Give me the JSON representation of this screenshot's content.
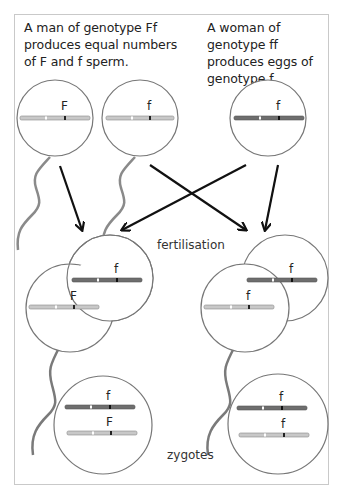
{
  "captions": {
    "man": "A man of genotype Ff produces equal numbers of F and f sperm.",
    "woman": "A woman of genotype ff produces eggs of genotype f."
  },
  "labels": {
    "fertilisation": "fertilisation",
    "zygotes": "zygotes"
  },
  "gametes": {
    "sperm_1": {
      "allele": "F",
      "chromosome_color": "#c8c8c8"
    },
    "sperm_2": {
      "allele": "f",
      "chromosome_color": "#c8c8c8"
    },
    "egg": {
      "allele": "f",
      "chromosome_color": "#6e6e6e"
    }
  },
  "fertilisation": {
    "left": {
      "egg_allele": "f",
      "sperm_allele": "F"
    },
    "right": {
      "egg_allele": "f",
      "sperm_allele": "f"
    }
  },
  "zygotes": {
    "left": {
      "top_allele": "f",
      "bottom_allele": "F"
    },
    "right": {
      "top_allele": "f",
      "bottom_allele": "f"
    }
  },
  "colors": {
    "paternal_chromosome": "#c8c8c8",
    "maternal_chromosome": "#6e6e6e",
    "outline": "#777777",
    "arrow": "#111111",
    "border": "#c9c9c9"
  }
}
